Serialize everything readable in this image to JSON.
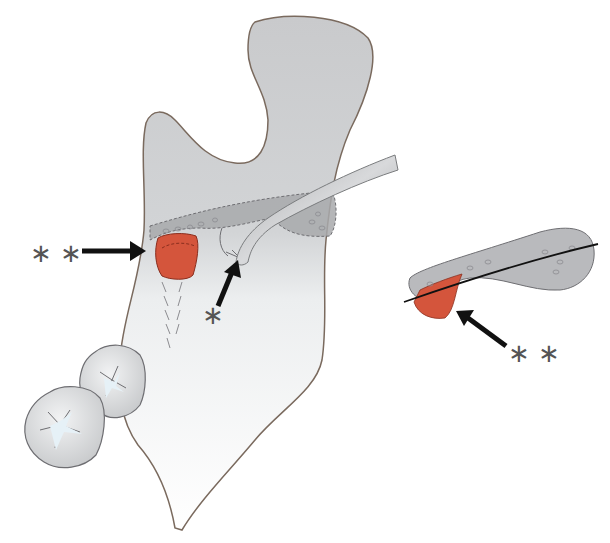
{
  "figure": {
    "colors": {
      "bone": "#c8c9cb",
      "bone_light": "#eef0f1",
      "outline": "#7a6a5e",
      "highlight": "#d4553c",
      "arrow": "#111111",
      "label": "#555555"
    }
  },
  "labels": {
    "left_double_star": "∗ ∗",
    "single_star": "∗",
    "inset_double_star": "∗ ∗"
  }
}
